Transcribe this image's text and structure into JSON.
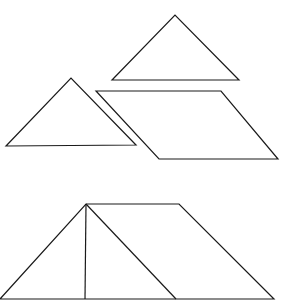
{
  "diagram": {
    "title": "",
    "stroke_color": "#1a1a1a",
    "background": "#ffffff",
    "shapes": {
      "top_triangle": "112,80 175,15 239,80",
      "left_triangle": "6,146 71,78 136,145",
      "parallelogram": "96,91 221,91 278,159 159,159",
      "assembled_trapezoid": "0,299 86,204 179,204 274,299",
      "assembled_vertical_line": "86,204 85,299",
      "assembled_diagonal_line": "86,204 176,299"
    }
  }
}
